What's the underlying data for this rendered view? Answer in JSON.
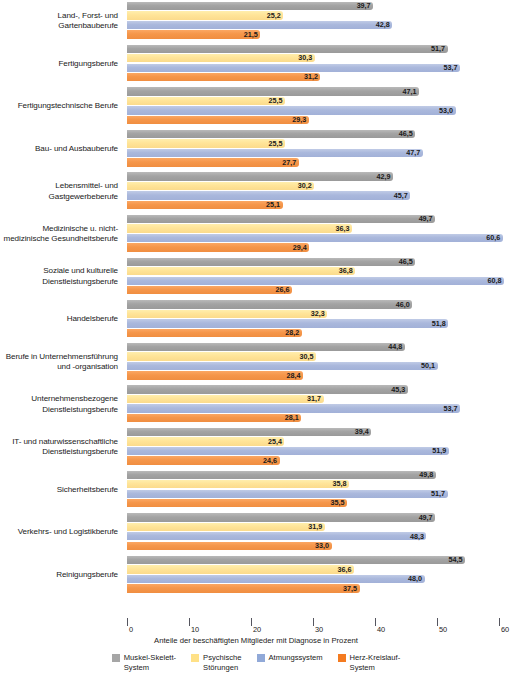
{
  "chart_data": {
    "type": "bar",
    "orientation": "horizontal",
    "title": "",
    "xlabel": "Anteile der beschäftigten Mitglieder mit Diagnose in Prozent",
    "ylabel": "",
    "xlim": [
      0,
      62
    ],
    "xticks": [
      0,
      10,
      20,
      30,
      40,
      50,
      60
    ],
    "xticklabels": [
      "0",
      "10",
      "20",
      "30",
      "40",
      "50",
      "60"
    ],
    "grid": false,
    "legend_position": "bottom",
    "decimal_separator": ",",
    "categories": [
      "Land-, Forst- und\nGartenbauberufe",
      "Fertigungsberufe",
      "Fertigungstechnische Berufe",
      "Bau- und Ausbauberufe",
      "Lebensmittel- und\nGastgewerbeberufe",
      "Medizinische u. nicht-\nmedizinische Gesundheitsberufe",
      "Soziale und kulturelle\nDienstleistungsberufe",
      "Handelsberufe",
      "Berufe in Unternehmensführung\nund -organisation",
      "Unternehmensbezogene\nDienstleistungsberufe",
      "IT- und naturwissenschaftliche\nDienstleistungsberufe",
      "Sicherheitsberufe",
      "Verkehrs- und Logistikberufe",
      "Reinigungsberufe"
    ],
    "series": [
      {
        "name": "Muskel-Skelett-System",
        "legend_label": "Muskel-Skelett-\nSystem",
        "color": "#a6a6a6",
        "values": [
          39.7,
          51.7,
          47.1,
          46.5,
          42.9,
          49.7,
          46.5,
          46.0,
          44.8,
          45.3,
          39.4,
          49.8,
          49.7,
          54.5
        ],
        "labels": [
          "39,7",
          "51,7",
          "47,1",
          "46,5",
          "42,9",
          "49,7",
          "46,5",
          "46,0",
          "44,8",
          "45,3",
          "39,4",
          "49,8",
          "49,7",
          "54,5"
        ]
      },
      {
        "name": "Psychische Störungen",
        "legend_label": "Psychische\nStörungen",
        "color": "#ffe187",
        "values": [
          25.2,
          30.3,
          25.5,
          25.5,
          30.2,
          36.3,
          36.8,
          32.3,
          30.5,
          31.7,
          25.4,
          35.8,
          31.9,
          36.6
        ],
        "labels": [
          "25,2",
          "30,3",
          "25,5",
          "25,5",
          "30,2",
          "36,3",
          "36,8",
          "32,3",
          "30,5",
          "31,7",
          "25,4",
          "35,8",
          "31,9",
          "36,6"
        ]
      },
      {
        "name": "Atmungssystem",
        "legend_label": "Atmungssystem",
        "color": "#91a9d8",
        "values": [
          42.8,
          53.7,
          53.0,
          47.7,
          45.7,
          60.6,
          60.8,
          51.8,
          50.1,
          53.7,
          51.9,
          51.7,
          48.3,
          48.0
        ],
        "labels": [
          "42,8",
          "53,7",
          "53,0",
          "47,7",
          "45,7",
          "60,6",
          "60,8",
          "51,8",
          "50,1",
          "53,7",
          "51,9",
          "51,7",
          "48,3",
          "48,0"
        ]
      },
      {
        "name": "Herz-Kreislauf-System",
        "legend_label": "Herz-Kreislauf-\nSystem",
        "color": "#f47b20",
        "values": [
          21.5,
          31.2,
          29.3,
          27.7,
          25.1,
          29.4,
          26.6,
          28.2,
          28.4,
          28.1,
          24.6,
          35.5,
          33.0,
          37.5
        ],
        "labels": [
          "21,5",
          "31,2",
          "29,3",
          "27,7",
          "25,1",
          "29,4",
          "26,6",
          "28,2",
          "28,4",
          "28,1",
          "24,6",
          "35,5",
          "33,0",
          "37,5"
        ]
      }
    ]
  },
  "legend": {
    "items": [
      {
        "label": "Muskel-Skelett-\nSystem",
        "color": "#a6a6a6",
        "key": "grey"
      },
      {
        "label": "Psychische\nStörungen",
        "color": "#ffe187",
        "key": "yellow"
      },
      {
        "label": "Atmungssystem",
        "color": "#91a9d8",
        "key": "blue"
      },
      {
        "label": "Herz-Kreislauf-\nSystem",
        "color": "#f47b20",
        "key": "orange"
      }
    ]
  }
}
